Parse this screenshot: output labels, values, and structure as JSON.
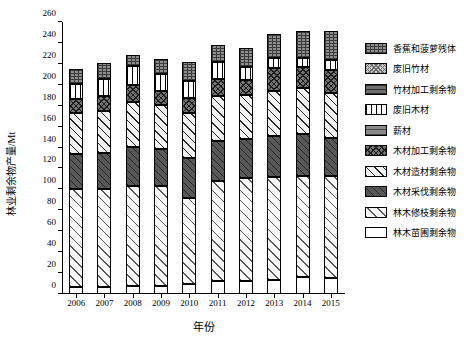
{
  "chart_data": {
    "type": "bar",
    "stacked": true,
    "title": "",
    "xlabel": "年份",
    "ylabel": "林业剩余物产量/Mt",
    "ylim": [
      0,
      260
    ],
    "yticks": [
      0,
      20,
      40,
      60,
      80,
      100,
      120,
      140,
      160,
      180,
      200,
      220,
      240,
      260
    ],
    "grid": false,
    "legend_position": "right",
    "categories": [
      "2006",
      "2007",
      "2008",
      "2009",
      "2010",
      "2011",
      "2012",
      "2013",
      "2014",
      "2015"
    ],
    "series": [
      {
        "name": "林木苗圃剩余物",
        "pattern": "p-nursery",
        "values": [
          7,
          7,
          7.5,
          8,
          9.5,
          12,
          12.5,
          13.5,
          16,
          15
        ]
      },
      {
        "name": "林木修枝剩余物",
        "pattern": "p-prune",
        "values": [
          93.5,
          93.5,
          95.5,
          95.5,
          82.5,
          96.5,
          98,
          98.5,
          97,
          98
        ]
      },
      {
        "name": "木材采伐剩余物",
        "pattern": "p-woodcut",
        "values": [
          33.5,
          34.5,
          38,
          35,
          38,
          38,
          38,
          39,
          40,
          36
        ]
      },
      {
        "name": "木材造材剩余物",
        "pattern": "p-woodmake",
        "values": [
          39.5,
          40,
          42.5,
          42,
          43,
          43,
          41.5,
          43,
          43.5,
          43
        ]
      },
      {
        "name": "木材加工剩余物",
        "pattern": "p-woodproc",
        "values": [
          12.5,
          14.5,
          16.5,
          13.5,
          14.5,
          16.5,
          15,
          22,
          20.5,
          22
        ]
      },
      {
        "name": "薪材",
        "pattern": "p-firewood",
        "values": [
          0,
          0,
          0,
          0,
          0,
          0,
          0,
          0,
          0,
          0
        ]
      },
      {
        "name": "废旧木材",
        "pattern": "p-oldwood",
        "values": [
          14.5,
          16,
          17.5,
          16,
          16,
          16,
          12,
          9.5,
          8.5,
          10
        ]
      },
      {
        "name": "竹材加工剩余物",
        "pattern": "p-bambooproc",
        "values": [
          0,
          0,
          0,
          0,
          0,
          0,
          0,
          0,
          0,
          0
        ]
      },
      {
        "name": "废旧竹材",
        "pattern": "p-oldbamboo",
        "values": [
          0,
          0,
          0,
          0,
          0,
          0,
          0,
          0,
          0,
          0
        ]
      },
      {
        "name": "香蕉和菠萝残体",
        "pattern": "p-banana",
        "values": [
          15,
          15,
          10.5,
          15,
          18.5,
          16.5,
          18,
          23,
          26,
          27
        ]
      }
    ],
    "totals": [
      215.5,
      220.5,
      228,
      225,
      221.5,
      238.5,
      235,
      248.5,
      251.5,
      251
    ]
  },
  "legend": {
    "items": [
      {
        "label": "香蕉和菠萝残体",
        "pattern": "p-banana"
      },
      {
        "label": "废旧竹材",
        "pattern": "p-oldbamboo"
      },
      {
        "label": "竹材加工剩余物",
        "pattern": "p-bambooproc"
      },
      {
        "label": "废旧木材",
        "pattern": "p-oldwood"
      },
      {
        "label": "薪材",
        "pattern": "p-firewood"
      },
      {
        "label": "木材加工剩余物",
        "pattern": "p-woodproc"
      },
      {
        "label": "木材造材剩余物",
        "pattern": "p-woodmake"
      },
      {
        "label": "木材采伐剩余物",
        "pattern": "p-woodcut"
      },
      {
        "label": "林木修枝剩余物",
        "pattern": "p-prune"
      },
      {
        "label": "林木苗圃剩余物",
        "pattern": "p-nursery"
      }
    ]
  },
  "colors": {
    "axis": "#000000",
    "background": "#ffffff",
    "text": "#000000"
  }
}
